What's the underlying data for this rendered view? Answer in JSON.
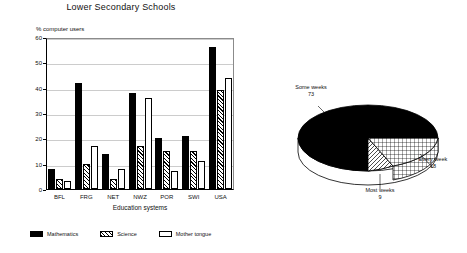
{
  "title": "Lower Secondary Schools",
  "bar_chart": {
    "y_axis_title": "% computer users",
    "x_axis_title": "Education systems",
    "y_ticks": [
      "0",
      "10",
      "20",
      "30",
      "40",
      "50",
      "60"
    ],
    "categories": [
      "BFL",
      "FRG",
      "NET",
      "NWZ",
      "POR",
      "SWI",
      "USA"
    ],
    "legend": [
      {
        "label": "Mathematics",
        "pattern": "solid-black"
      },
      {
        "label": "Science",
        "pattern": "diagonal-hatch"
      },
      {
        "label": "Mother tongue",
        "pattern": "white"
      }
    ]
  },
  "pie_chart": {
    "slices": [
      {
        "name": "Some weeks",
        "value": "73",
        "pattern": "solid-black"
      },
      {
        "name": "Every week",
        "value": "18",
        "pattern": "cross-hatch"
      },
      {
        "name": "Most weeks",
        "value": "9",
        "pattern": "diagonal-hatch"
      }
    ]
  },
  "chart_data": [
    {
      "type": "bar",
      "title": "Lower Secondary Schools",
      "xlabel": "Education systems",
      "ylabel": "% computer users",
      "ylim": [
        0,
        60
      ],
      "ytick_step": 10,
      "grid": true,
      "legend_position": "bottom",
      "categories": [
        "BFL",
        "FRG",
        "NET",
        "NWZ",
        "POR",
        "SWI",
        "USA"
      ],
      "series": [
        {
          "name": "Mathematics",
          "values": [
            8,
            42,
            14,
            38,
            20,
            21,
            56
          ]
        },
        {
          "name": "Science",
          "values": [
            4,
            10,
            4,
            17,
            15,
            15,
            39
          ]
        },
        {
          "name": "Mother tongue",
          "values": [
            3,
            17,
            8,
            36,
            7,
            11,
            44
          ]
        }
      ]
    },
    {
      "type": "pie",
      "title": "",
      "labels": [
        "Some weeks",
        "Every week",
        "Most weeks"
      ],
      "values": [
        73,
        18,
        9
      ],
      "legend_position": "callout-labels",
      "three_d": true
    }
  ]
}
